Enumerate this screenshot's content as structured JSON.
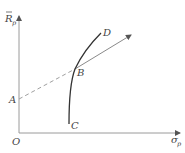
{
  "diagram": {
    "type": "efficient-frontier-capital-market-line",
    "axes": {
      "y_label": "R",
      "y_label_bar": true,
      "y_label_sub": "p",
      "x_label": "σ",
      "x_label_sub": "p",
      "origin_label": "O"
    },
    "points": {
      "A": "A",
      "B": "B",
      "C": "C",
      "D": "D"
    },
    "colors": {
      "axis": "#9a9a9a",
      "curve": "#333333",
      "line": "#8a8a8a",
      "dashed": "#a0a0a0",
      "text": "#444444"
    }
  }
}
